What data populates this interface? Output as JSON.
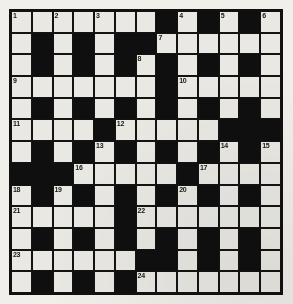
{
  "puzzle": {
    "type": "crossword-grid",
    "rows": 13,
    "cols": 13,
    "colors": {
      "block": "#100f0f",
      "open": "#e9e8e3",
      "grid_line": "#141313",
      "paper": "#f0efea",
      "number_text": "#16150f"
    },
    "legend": {
      "black": "blocked square",
      "white": "fillable square"
    },
    "grid": [
      [
        "W",
        "W",
        "W",
        "W",
        "W",
        "W",
        "W",
        "B",
        "W",
        "B",
        "W",
        "B",
        "W"
      ],
      [
        "W",
        "B",
        "W",
        "B",
        "W",
        "B",
        "B",
        "W",
        "W",
        "W",
        "W",
        "W",
        "W"
      ],
      [
        "W",
        "B",
        "W",
        "B",
        "W",
        "B",
        "W",
        "B",
        "W",
        "B",
        "W",
        "B",
        "W"
      ],
      [
        "W",
        "W",
        "W",
        "W",
        "W",
        "W",
        "W",
        "B",
        "W",
        "W",
        "W",
        "W",
        "W"
      ],
      [
        "W",
        "B",
        "W",
        "B",
        "W",
        "B",
        "W",
        "B",
        "W",
        "B",
        "W",
        "B",
        "W"
      ],
      [
        "W",
        "W",
        "W",
        "W",
        "B",
        "W",
        "W",
        "W",
        "W",
        "W",
        "B",
        "B",
        "B"
      ],
      [
        "W",
        "B",
        "W",
        "B",
        "W",
        "B",
        "W",
        "B",
        "W",
        "B",
        "W",
        "B",
        "W"
      ],
      [
        "B",
        "B",
        "B",
        "W",
        "W",
        "W",
        "W",
        "W",
        "B",
        "W",
        "W",
        "W",
        "W"
      ],
      [
        "W",
        "B",
        "W",
        "B",
        "W",
        "B",
        "W",
        "B",
        "W",
        "B",
        "W",
        "B",
        "W"
      ],
      [
        "W",
        "W",
        "W",
        "W",
        "W",
        "B",
        "W",
        "W",
        "W",
        "W",
        "W",
        "W",
        "W"
      ],
      [
        "W",
        "B",
        "W",
        "B",
        "W",
        "B",
        "W",
        "B",
        "W",
        "B",
        "W",
        "B",
        "W"
      ],
      [
        "W",
        "W",
        "W",
        "W",
        "W",
        "W",
        "B",
        "B",
        "W",
        "B",
        "W",
        "B",
        "W"
      ],
      [
        "W",
        "B",
        "W",
        "B",
        "W",
        "B",
        "W",
        "W",
        "W",
        "W",
        "W",
        "W",
        "W"
      ]
    ],
    "numbers": [
      {
        "n": "1",
        "row": 0,
        "col": 0
      },
      {
        "n": "2",
        "row": 0,
        "col": 2
      },
      {
        "n": "3",
        "row": 0,
        "col": 4
      },
      {
        "n": "4",
        "row": 0,
        "col": 8
      },
      {
        "n": "5",
        "row": 0,
        "col": 10
      },
      {
        "n": "6",
        "row": 0,
        "col": 12
      },
      {
        "n": "7",
        "row": 1,
        "col": 7
      },
      {
        "n": "8",
        "row": 2,
        "col": 6
      },
      {
        "n": "9",
        "row": 3,
        "col": 0
      },
      {
        "n": "10",
        "row": 3,
        "col": 8
      },
      {
        "n": "11",
        "row": 5,
        "col": 0
      },
      {
        "n": "12",
        "row": 5,
        "col": 5
      },
      {
        "n": "13",
        "row": 6,
        "col": 4
      },
      {
        "n": "14",
        "row": 6,
        "col": 10
      },
      {
        "n": "15",
        "row": 6,
        "col": 12
      },
      {
        "n": "16",
        "row": 7,
        "col": 3
      },
      {
        "n": "17",
        "row": 7,
        "col": 9
      },
      {
        "n": "18",
        "row": 8,
        "col": 0
      },
      {
        "n": "19",
        "row": 8,
        "col": 2
      },
      {
        "n": "20",
        "row": 8,
        "col": 8
      },
      {
        "n": "21",
        "row": 9,
        "col": 0
      },
      {
        "n": "22",
        "row": 9,
        "col": 6
      },
      {
        "n": "23",
        "row": 11,
        "col": 0
      },
      {
        "n": "24",
        "row": 12,
        "col": 6
      }
    ]
  }
}
